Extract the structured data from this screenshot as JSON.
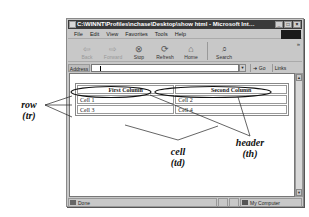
{
  "window": {
    "title": "C:\\WINNT\\Profiles\\nchase\\Desktop\\show html - Microsoft Internet Explorer",
    "controls": {
      "minimize": "_",
      "maximize": "□",
      "close": "×"
    }
  },
  "menubar": {
    "items": [
      "File",
      "Edit",
      "View",
      "Favorites",
      "Tools",
      "Help"
    ]
  },
  "toolbar": {
    "buttons": [
      {
        "label": "Back",
        "icon": "back-arrow-icon",
        "glyph": "⇦",
        "enabled": false
      },
      {
        "label": "Forward",
        "icon": "forward-arrow-icon",
        "glyph": "⇨",
        "enabled": false
      },
      {
        "label": "Stop",
        "icon": "stop-icon",
        "glyph": "⊗",
        "enabled": true
      },
      {
        "label": "Refresh",
        "icon": "refresh-icon",
        "glyph": "⟳",
        "enabled": true
      },
      {
        "label": "Home",
        "icon": "home-icon",
        "glyph": "⌂",
        "enabled": true
      },
      {
        "label": "Search",
        "icon": "search-icon",
        "glyph": "⌕",
        "enabled": true
      }
    ],
    "more": "»"
  },
  "addressbar": {
    "label": "Address",
    "value": "",
    "go_label": "Go",
    "links_label": "Links »"
  },
  "page": {
    "table": {
      "headers": [
        "First Column",
        "Second Column"
      ],
      "rows": [
        [
          "Cell 1",
          "Cell 2"
        ],
        [
          "Cell 3",
          "Cell 4"
        ]
      ]
    }
  },
  "statusbar": {
    "status": "Done",
    "zone": "My Computer"
  },
  "annotations": {
    "row": {
      "line1": "row",
      "line2": "(tr)"
    },
    "cell": {
      "line1": "cell",
      "line2": "(td)"
    },
    "header": {
      "line1": "header",
      "line2": "(th)"
    }
  }
}
